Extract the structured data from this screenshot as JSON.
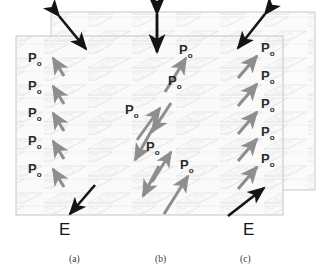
{
  "figure": {
    "kind": "ferroelectric-polarization-schematic",
    "panels": [
      {
        "id": "a",
        "caption": "(a)",
        "field_label": "E",
        "field_direction": "down-left",
        "top_double_arrow": "diagonal-nw-se",
        "polarization_label": "P",
        "polarization_subscript": "o",
        "polarization_direction": "up-left",
        "domain_count": 5,
        "labels": [
          "P",
          "P",
          "P",
          "P",
          "P"
        ],
        "subscripts": [
          "o",
          "o",
          "o",
          "o",
          "o"
        ]
      },
      {
        "id": "b",
        "caption": "(b)",
        "field_label": "",
        "field_direction": "none",
        "top_double_arrow": "vertical",
        "polarization_label": "P",
        "polarization_subscript": "o",
        "polarization_direction": "alternating",
        "domain_count": 4,
        "labels": [
          "P",
          "P",
          "P",
          "P"
        ],
        "subscripts": [
          "o",
          "o",
          "o",
          "o"
        ]
      },
      {
        "id": "c",
        "caption": "(c)",
        "field_label": "E",
        "field_direction": "up-right",
        "top_double_arrow": "diagonal-ne-sw",
        "polarization_label": "P",
        "polarization_subscript": "o",
        "polarization_direction": "up-right",
        "domain_count": 5,
        "labels": [
          "P",
          "P",
          "P",
          "P",
          "P"
        ],
        "subscripts": [
          "o",
          "o",
          "o",
          "o",
          "o"
        ]
      }
    ],
    "captions": [
      "(a)",
      "(b)",
      "(c)"
    ],
    "field_labels": [
      "E",
      "E"
    ],
    "colors": {
      "arrow_black": "#141414",
      "arrow_gray": "#8e8e8e",
      "box_border": "#b9b9b9",
      "box_fill": "#fafafa",
      "lattice": "#dcdcdc",
      "text": "#2a2a2a"
    }
  },
  "panel_a": {
    "caption": "(a)",
    "field": "E",
    "p0": [
      {
        "p": "P",
        "sub": "o"
      },
      {
        "p": "P",
        "sub": "o"
      },
      {
        "p": "P",
        "sub": "o"
      },
      {
        "p": "P",
        "sub": "o"
      },
      {
        "p": "P",
        "sub": "o"
      }
    ]
  },
  "panel_b": {
    "caption": "(b)",
    "field": "",
    "p0": [
      {
        "p": "P",
        "sub": "o"
      },
      {
        "p": "P",
        "sub": "o"
      },
      {
        "p": "P",
        "sub": "o"
      },
      {
        "p": "P",
        "sub": "o"
      }
    ]
  },
  "panel_c": {
    "caption": "(c)",
    "field": "E",
    "p0": [
      {
        "p": "P",
        "sub": "o"
      },
      {
        "p": "P",
        "sub": "o"
      },
      {
        "p": "P",
        "sub": "o"
      },
      {
        "p": "P",
        "sub": "o"
      },
      {
        "p": "P",
        "sub": "o"
      }
    ]
  }
}
